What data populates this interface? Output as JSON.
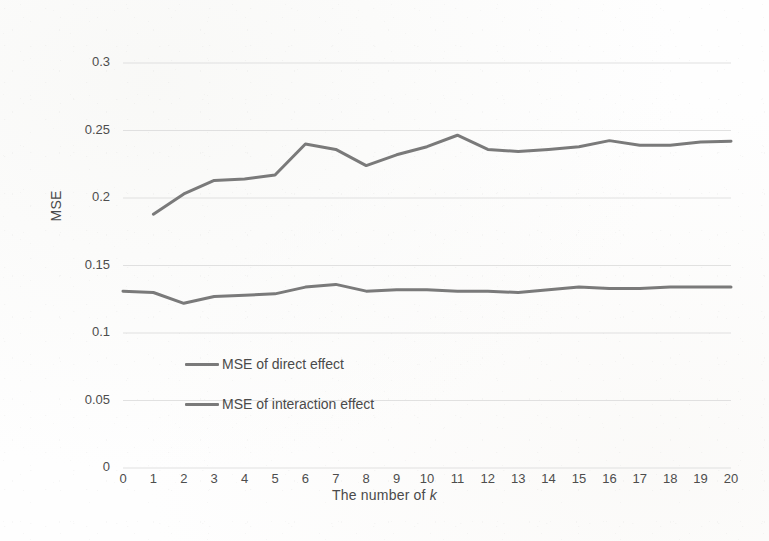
{
  "figure": {
    "background_color": "#fefefe",
    "ink_color": "#4a4a4a",
    "gridline_color": "#d9d9d9"
  },
  "chart_data": {
    "type": "line",
    "title": "",
    "xlabel_prefix": "The number of ",
    "xlabel_italic": "k",
    "ylabel": "MSE",
    "xlim": [
      0,
      20
    ],
    "ylim": [
      0,
      0.3
    ],
    "ytick_values": [
      0,
      0.05,
      0.1,
      0.15,
      0.2,
      0.25,
      0.3
    ],
    "ytick_labels": [
      "0",
      "0.05",
      "0.1",
      "0.15",
      "0.2",
      "0.25",
      "0.3"
    ],
    "xtick_values": [
      0,
      1,
      2,
      3,
      4,
      5,
      6,
      7,
      8,
      9,
      10,
      11,
      12,
      13,
      14,
      15,
      16,
      17,
      18,
      19,
      20
    ],
    "xtick_labels": [
      "0",
      "1",
      "2",
      "3",
      "4",
      "5",
      "6",
      "7",
      "8",
      "9",
      "10",
      "11",
      "12",
      "13",
      "14",
      "15",
      "16",
      "17",
      "18",
      "19",
      "20"
    ],
    "grid": "horizontal",
    "legend_position": "inside-lower-left",
    "series": [
      {
        "name": "MSE of direct effect",
        "color": "#7a7a7a",
        "linewidth": 3,
        "x": [
          0,
          1,
          2,
          3,
          4,
          5,
          6,
          7,
          8,
          9,
          10,
          11,
          12,
          13,
          14,
          15,
          16,
          17,
          18,
          19,
          20
        ],
        "values": [
          0.131,
          0.13,
          0.122,
          0.127,
          0.128,
          0.129,
          0.134,
          0.136,
          0.131,
          0.132,
          0.132,
          0.131,
          0.131,
          0.13,
          0.132,
          0.134,
          0.133,
          0.133,
          0.134,
          0.134,
          0.134
        ]
      },
      {
        "name": "MSE of interaction effect",
        "color": "#7a7a7a",
        "linewidth": 3,
        "x": [
          1,
          2,
          3,
          4,
          5,
          6,
          7,
          8,
          9,
          10,
          11,
          12,
          13,
          14,
          15,
          16,
          17,
          18,
          19,
          20
        ],
        "values": [
          0.188,
          0.203,
          0.213,
          0.214,
          0.217,
          0.24,
          0.236,
          0.224,
          0.232,
          0.238,
          0.2465,
          0.236,
          0.2345,
          0.236,
          0.238,
          0.2425,
          0.239,
          0.239,
          0.2415,
          0.242
        ]
      }
    ],
    "legend_entries": [
      {
        "label": "MSE of direct effect",
        "color": "#7a7a7a"
      },
      {
        "label": "MSE of interaction effect",
        "color": "#7a7a7a"
      }
    ]
  }
}
